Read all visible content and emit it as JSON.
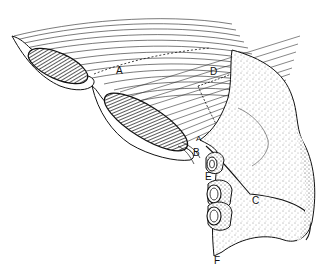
{
  "figure": {
    "background": "#ffffff",
    "ink": "#111111",
    "labels": [
      {
        "id": "A",
        "text": "A",
        "x": 116,
        "y": 74
      },
      {
        "id": "A2",
        "text": "A",
        "x": 196,
        "y": 141
      },
      {
        "id": "B",
        "text": "B",
        "x": 193,
        "y": 156
      },
      {
        "id": "C",
        "text": "C",
        "x": 252,
        "y": 204
      },
      {
        "id": "D",
        "text": "D",
        "x": 210,
        "y": 75
      },
      {
        "id": "E",
        "text": "E",
        "x": 205,
        "y": 180
      },
      {
        "id": "F",
        "text": "F",
        "x": 214,
        "y": 264
      }
    ]
  }
}
